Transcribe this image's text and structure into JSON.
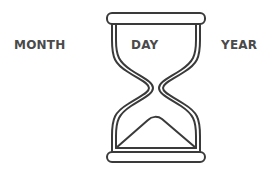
{
  "labels": {
    "left": "MONTH",
    "center": "DAY",
    "right": "YEAR"
  },
  "icon": {
    "name": "hourglass-icon",
    "stroke_color": "#3a3a3a"
  },
  "colors": {
    "text": "#4a4a4a",
    "background": "#ffffff"
  }
}
